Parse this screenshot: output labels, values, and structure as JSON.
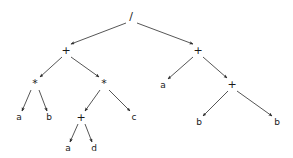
{
  "diagram": {
    "type": "binary-expression-tree",
    "background_color": "#ffffff",
    "edge_color": "#2b2b2b",
    "text_color": "#1a1a1a",
    "expression": "((a*b)+((a+d)*c))/(a+(b+b))",
    "nodes": [
      {
        "id": "n0",
        "label": "/",
        "kind": "operator",
        "x": 131,
        "y": 16,
        "depth": 0
      },
      {
        "id": "n1",
        "label": "+",
        "kind": "operator",
        "x": 66,
        "y": 50,
        "depth": 1
      },
      {
        "id": "n2",
        "label": "+",
        "kind": "operator",
        "x": 198,
        "y": 50,
        "depth": 1
      },
      {
        "id": "n3",
        "label": "*",
        "kind": "operator",
        "x": 35,
        "y": 83,
        "depth": 2
      },
      {
        "id": "n4",
        "label": "*",
        "kind": "operator",
        "x": 104,
        "y": 83,
        "depth": 2
      },
      {
        "id": "n5",
        "label": "a",
        "kind": "leaf",
        "x": 163,
        "y": 85,
        "depth": 2
      },
      {
        "id": "n6",
        "label": "+",
        "kind": "operator",
        "x": 232,
        "y": 84,
        "depth": 2
      },
      {
        "id": "n7",
        "label": "a",
        "kind": "leaf",
        "x": 19,
        "y": 117,
        "depth": 3
      },
      {
        "id": "n8",
        "label": "b",
        "kind": "leaf",
        "x": 49,
        "y": 117,
        "depth": 3
      },
      {
        "id": "n9",
        "label": "+",
        "kind": "operator",
        "x": 81,
        "y": 117,
        "depth": 3
      },
      {
        "id": "n10",
        "label": "c",
        "kind": "leaf",
        "x": 134,
        "y": 117,
        "depth": 3
      },
      {
        "id": "n11",
        "label": "b",
        "kind": "leaf",
        "x": 199,
        "y": 122,
        "depth": 3
      },
      {
        "id": "n12",
        "label": "b",
        "kind": "leaf",
        "x": 277,
        "y": 122,
        "depth": 3
      },
      {
        "id": "n13",
        "label": "a",
        "kind": "leaf",
        "x": 68,
        "y": 148,
        "depth": 4
      },
      {
        "id": "n14",
        "label": "d",
        "kind": "leaf",
        "x": 94,
        "y": 148,
        "depth": 4
      }
    ],
    "edges": [
      {
        "from": "n0",
        "to": "n1",
        "x1": 126,
        "y1": 23,
        "x2": 71,
        "y2": 44
      },
      {
        "from": "n0",
        "to": "n2",
        "x1": 137,
        "y1": 23,
        "x2": 193,
        "y2": 44
      },
      {
        "from": "n1",
        "to": "n3",
        "x1": 62,
        "y1": 57,
        "x2": 40,
        "y2": 77
      },
      {
        "from": "n1",
        "to": "n4",
        "x1": 71,
        "y1": 57,
        "x2": 99,
        "y2": 77
      },
      {
        "from": "n2",
        "to": "n5",
        "x1": 193,
        "y1": 57,
        "x2": 168,
        "y2": 79
      },
      {
        "from": "n2",
        "to": "n6",
        "x1": 203,
        "y1": 57,
        "x2": 227,
        "y2": 78
      },
      {
        "from": "n3",
        "to": "n7",
        "x1": 31,
        "y1": 90,
        "x2": 22,
        "y2": 111
      },
      {
        "from": "n3",
        "to": "n8",
        "x1": 39,
        "y1": 90,
        "x2": 47,
        "y2": 111
      },
      {
        "from": "n4",
        "to": "n9",
        "x1": 100,
        "y1": 90,
        "x2": 85,
        "y2": 111
      },
      {
        "from": "n4",
        "to": "n10",
        "x1": 109,
        "y1": 90,
        "x2": 130,
        "y2": 111
      },
      {
        "from": "n6",
        "to": "n11",
        "x1": 228,
        "y1": 91,
        "x2": 203,
        "y2": 116
      },
      {
        "from": "n6",
        "to": "n12",
        "x1": 237,
        "y1": 91,
        "x2": 272,
        "y2": 116
      },
      {
        "from": "n9",
        "to": "n13",
        "x1": 78,
        "y1": 124,
        "x2": 70,
        "y2": 142
      },
      {
        "from": "n9",
        "to": "n14",
        "x1": 85,
        "y1": 124,
        "x2": 92,
        "y2": 142
      }
    ]
  }
}
